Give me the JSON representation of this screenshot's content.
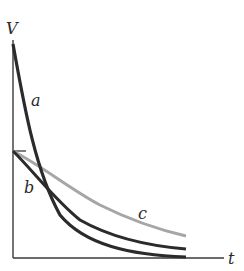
{
  "figure": {
    "axes": {
      "y_label": "V",
      "x_label": "t"
    },
    "curves": [
      {
        "id": "a",
        "label": "a",
        "color": "#2b2b2b",
        "description": "starts high, decays fastest"
      },
      {
        "id": "b",
        "label": "b",
        "color": "#2b2b2b",
        "description": "starts at half height, decays moderately"
      },
      {
        "id": "c",
        "label": "c",
        "color": "#a6a6a6",
        "description": "starts at half height, decays slowest"
      }
    ],
    "tick_mark": "initial value of curves b and c"
  }
}
